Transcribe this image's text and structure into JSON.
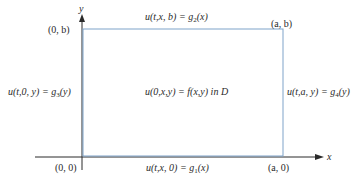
{
  "diagram": {
    "axes": {
      "x_label": "x",
      "y_label": "y"
    },
    "corners": {
      "origin": "(0, 0)",
      "top_left": "(0, b)",
      "top_right": "(a, b)",
      "bottom_right": "(a, 0)"
    },
    "boundary_conditions": {
      "top": {
        "lhs": "u(t,x, b) = g",
        "sub": "2",
        "rhs": "(x)"
      },
      "bottom": {
        "lhs": "u(t,x, 0) = g",
        "sub": "1",
        "rhs": "(x)"
      },
      "left": {
        "lhs": "u(t,0, y) = g",
        "sub": "3",
        "rhs": "(y)"
      },
      "right": {
        "lhs": "u(t,a, y) = g",
        "sub": "4",
        "rhs": "(y)"
      }
    },
    "interior": {
      "text": "u(0,x,y) = f(x,y) in D"
    },
    "colors": {
      "rectangle": "#7fa3c9",
      "axes": "#2a2a2a"
    }
  }
}
